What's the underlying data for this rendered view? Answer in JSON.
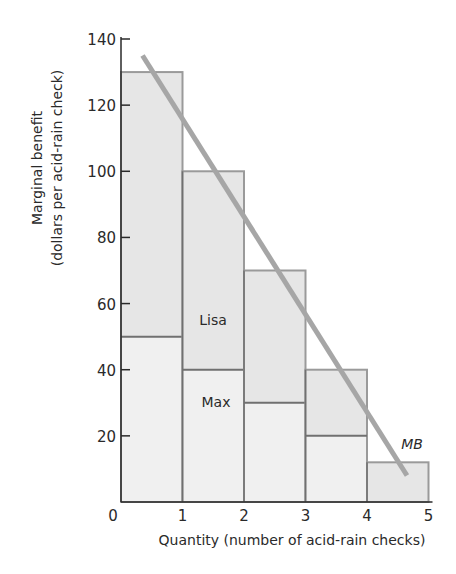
{
  "chart_data": {
    "type": "bar",
    "title": "",
    "xlabel": "Quantity (number of acid-rain checks)",
    "ylabel_line1": "Marginal benefit",
    "ylabel_line2": "(dollars per acid-rain check)",
    "ylim": [
      0,
      140
    ],
    "xlim": [
      0,
      5
    ],
    "x_ticks": [
      "0",
      "1",
      "2",
      "3",
      "4",
      "5"
    ],
    "y_ticks": [
      "20",
      "40",
      "60",
      "80",
      "100",
      "120",
      "140"
    ],
    "categories": [
      "1st check",
      "2nd check",
      "3rd check",
      "4th check",
      "5th check"
    ],
    "series": [
      {
        "name": "Max",
        "values": [
          50,
          40,
          30,
          20,
          0
        ]
      },
      {
        "name": "Lisa",
        "values": [
          80,
          60,
          40,
          20,
          12
        ]
      }
    ],
    "total_marginal_benefit": [
      130,
      100,
      70,
      40,
      12
    ],
    "mb_curve": {
      "name": "MB",
      "points": [
        [
          0.35,
          135
        ],
        [
          4.65,
          8
        ]
      ]
    },
    "annotations": [
      {
        "text": "Lisa",
        "x": 1.5,
        "y": 55
      },
      {
        "text": "Max",
        "x": 1.5,
        "y": 30
      },
      {
        "text": "MB",
        "x": 4.7,
        "y": 17
      }
    ],
    "grid": false,
    "legend": "none"
  },
  "labels": {
    "lisa": "Lisa",
    "max": "Max",
    "mb": "MB",
    "origin": "0"
  },
  "colors": {
    "upper_fill": "#e6e6e6",
    "lower_fill": "#f0f0f0",
    "bar_border": "#9a9a9a",
    "divider": "#707070",
    "axis": "#2a2a2a",
    "mb_line": "#a6a6a6"
  }
}
